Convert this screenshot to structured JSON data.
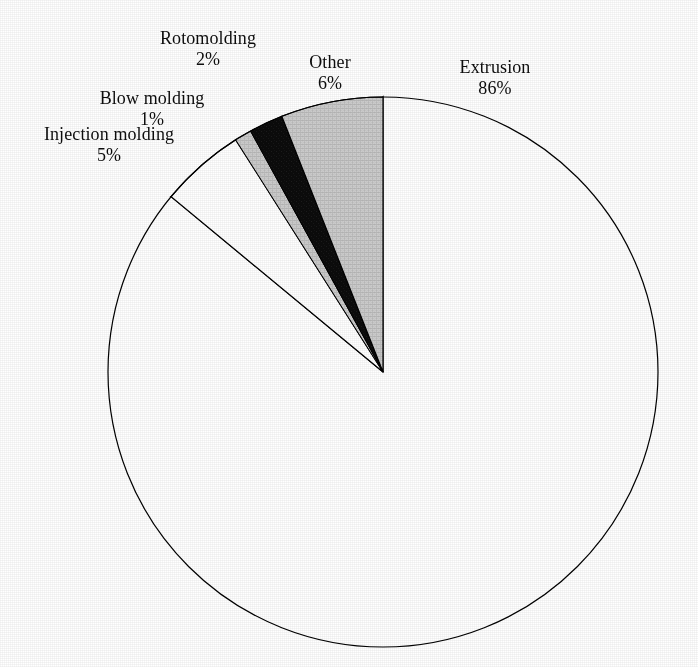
{
  "chart_data": {
    "type": "pie",
    "title": "",
    "subtitle": "",
    "xlabel": "",
    "ylabel": "",
    "legend_position": "none",
    "grid": false,
    "labels_show_percent": true,
    "start_angle_deg": 90,
    "direction": "counterclockwise",
    "categories": [
      "Extrusion",
      "Other",
      "Rotomolding",
      "Blow molding",
      "Injection molding"
    ],
    "values": [
      86,
      6,
      2,
      1,
      5
    ],
    "units": "%",
    "total": 100,
    "slices": [
      {
        "name": "Extrusion",
        "value": 86,
        "percent_label": "86%",
        "color": "#0d0d0d",
        "stroke": "#000000",
        "label_name": "Extrusion",
        "label_percent": "86%"
      },
      {
        "name": "Other",
        "value": 6,
        "percent_label": "6%",
        "color": "#c9c9c9",
        "stroke": "#000000",
        "label_name": "Other",
        "label_percent": "6%"
      },
      {
        "name": "Rotomolding",
        "value": 2,
        "percent_label": "2%",
        "color": "#121212",
        "stroke": "#000000",
        "label_name": "Rotomolding",
        "label_percent": "2%"
      },
      {
        "name": "Blow molding",
        "value": 1,
        "percent_label": "1%",
        "color": "#c9c9c9",
        "stroke": "#000000",
        "label_name": "Blow molding",
        "label_percent": "1%"
      },
      {
        "name": "Injection molding",
        "value": 5,
        "percent_label": "5%",
        "color": "#ffffff",
        "stroke": "#000000",
        "label_name": "Injection molding",
        "label_percent": "5%"
      }
    ]
  },
  "colors": {
    "background": "#ffffff",
    "text": "#0d0d0d",
    "slice_dark": "#0d0d0d",
    "slice_gray": "#c9c9c9",
    "slice_white": "#ffffff",
    "outline": "#000000"
  }
}
